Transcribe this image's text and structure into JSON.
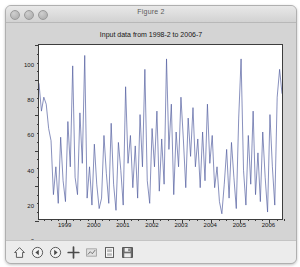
{
  "window": {
    "title": "Figure 2",
    "controls": [
      {
        "name": "close-button"
      },
      {
        "name": "minimize-button"
      },
      {
        "name": "zoom-button"
      }
    ]
  },
  "toolbar": {
    "buttons": [
      {
        "name": "home-icon",
        "tooltip": "Reset original view"
      },
      {
        "name": "back-arrow-icon",
        "tooltip": "Back to previous view"
      },
      {
        "name": "forward-arrow-icon",
        "tooltip": "Forward to next view"
      },
      {
        "name": "pan-move-icon",
        "tooltip": "Pan axes with left mouse, zoom with right"
      },
      {
        "name": "zoom-rectangle-icon",
        "tooltip": "Zoom to rectangle"
      },
      {
        "name": "configure-subplots-icon",
        "tooltip": "Configure subplots"
      },
      {
        "name": "save-floppy-icon",
        "tooltip": "Save the figure"
      }
    ]
  },
  "colors": {
    "line": "#5560a0",
    "axes_edge": "#3d3d3d",
    "figure_bg": "#d4d4d4",
    "axes_bg": "#ffffff",
    "text": "#141414"
  },
  "chart_data": {
    "type": "line",
    "title": "Input data from 1998-2 to 2006-7",
    "xlabel": "",
    "ylabel": "",
    "grid": false,
    "legend": null,
    "xlim": [
      1998.083,
      2006.5
    ],
    "ylim": [
      0,
      100
    ],
    "xticks": [
      1999,
      2000,
      2001,
      2002,
      2003,
      2004,
      2005,
      2006
    ],
    "xticklabels": [
      "1999",
      "2000",
      "2001",
      "2002",
      "2003",
      "2004",
      "2005",
      "2006"
    ],
    "yticks": [
      0,
      20,
      40,
      60,
      80,
      100
    ],
    "yticklabels": [
      "0",
      "20",
      "40",
      "60",
      "80",
      "100"
    ],
    "x": [
      1998.083,
      1998.167,
      1998.25,
      1998.333,
      1998.417,
      1998.5,
      1998.583,
      1998.667,
      1998.75,
      1998.833,
      1998.917,
      1999.0,
      1999.083,
      1999.167,
      1999.25,
      1999.333,
      1999.417,
      1999.5,
      1999.583,
      1999.667,
      1999.75,
      1999.833,
      1999.917,
      2000.0,
      2000.083,
      2000.167,
      2000.25,
      2000.333,
      2000.417,
      2000.5,
      2000.583,
      2000.667,
      2000.75,
      2000.833,
      2000.917,
      2001.0,
      2001.083,
      2001.167,
      2001.25,
      2001.333,
      2001.417,
      2001.5,
      2001.583,
      2001.667,
      2001.75,
      2001.833,
      2001.917,
      2002.0,
      2002.083,
      2002.167,
      2002.25,
      2002.333,
      2002.417,
      2002.5,
      2002.583,
      2002.667,
      2002.75,
      2002.833,
      2002.917,
      2003.0,
      2003.083,
      2003.167,
      2003.25,
      2003.333,
      2003.417,
      2003.5,
      2003.583,
      2003.667,
      2003.75,
      2003.833,
      2003.917,
      2004.0,
      2004.083,
      2004.167,
      2004.25,
      2004.333,
      2004.417,
      2004.5,
      2004.583,
      2004.667,
      2004.75,
      2004.833,
      2004.917,
      2005.0,
      2005.083,
      2005.167,
      2005.25,
      2005.333,
      2005.417,
      2005.5,
      2005.583,
      2005.667,
      2005.75,
      2005.833,
      2005.917,
      2006.0,
      2006.083,
      2006.167,
      2006.25,
      2006.333,
      2006.417,
      2006.5
    ],
    "y": [
      78,
      62,
      70,
      66,
      52,
      45,
      14,
      30,
      9,
      47,
      22,
      10,
      56,
      30,
      88,
      24,
      14,
      61,
      32,
      94,
      12,
      30,
      8,
      43,
      20,
      6,
      12,
      48,
      26,
      9,
      55,
      20,
      5,
      44,
      28,
      8,
      76,
      32,
      48,
      18,
      42,
      12,
      60,
      30,
      86,
      22,
      9,
      52,
      30,
      62,
      16,
      46,
      20,
      92,
      40,
      66,
      14,
      50,
      30,
      70,
      46,
      18,
      58,
      36,
      64,
      30,
      46,
      18,
      50,
      22,
      66,
      32,
      48,
      18,
      30,
      10,
      3,
      20,
      40,
      12,
      44,
      24,
      6,
      58,
      92,
      28,
      8,
      48,
      20,
      62,
      14,
      38,
      10,
      50,
      24,
      4,
      60,
      30,
      8,
      70,
      86,
      72
    ]
  }
}
